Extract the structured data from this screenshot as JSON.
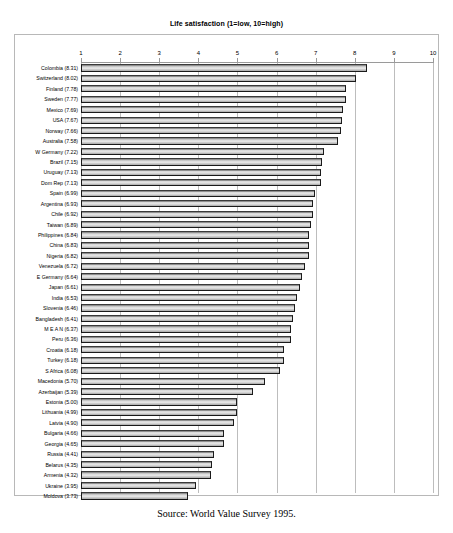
{
  "chart_data": {
    "type": "bar",
    "orientation": "horizontal",
    "title": "Life satisfaction (1=low, 10=high)",
    "xlabel": "",
    "ylabel": "",
    "xlim": [
      1,
      10
    ],
    "grid": true,
    "legend": null,
    "tick_labels": [
      "1",
      "2",
      "3",
      "4",
      "5",
      "6",
      "7",
      "8",
      "9",
      "10"
    ],
    "categories": [
      "Colombia",
      "Switzerland",
      "Finland",
      "Sweden",
      "Mexico",
      "USA",
      "Norway",
      "Australia",
      "W Germany",
      "Brazil",
      "Uruguay",
      "Dom Rep",
      "Spain",
      "Argentina",
      "Chile",
      "Taiwan",
      "Philippines",
      "China",
      "Nigeria",
      "Venezuela",
      "E Germany",
      "Japan",
      "India",
      "Slovenia",
      "Bangladesh",
      "M E A N",
      "Peru",
      "Croatia",
      "Turkey",
      "S Africa",
      "Macedonia",
      "Azerbaijan",
      "Estonia",
      "Lithuania",
      "Latvia",
      "Bulgaria",
      "Georgia",
      "Russia",
      "Belarus",
      "Armenia",
      "Ukraine",
      "Moldova"
    ],
    "values": [
      8.31,
      8.02,
      7.78,
      7.77,
      7.69,
      7.67,
      7.66,
      7.58,
      7.22,
      7.15,
      7.13,
      7.13,
      6.99,
      6.93,
      6.92,
      6.89,
      6.84,
      6.83,
      6.82,
      6.72,
      6.64,
      6.61,
      6.53,
      6.46,
      6.41,
      6.37,
      6.36,
      6.18,
      6.18,
      6.08,
      5.7,
      5.39,
      5.0,
      4.99,
      4.9,
      4.66,
      4.65,
      4.41,
      4.35,
      4.32,
      3.95,
      3.73
    ],
    "row_labels": [
      "Colombia (8.31)",
      "Switzerland (8.02)",
      "Finland (7.78)",
      "Sweden (7.77)",
      "Mexico (7.69)",
      "USA (7.67)",
      "Norway (7.66)",
      "Australia (7.58)",
      "W Germany (7.22)",
      "Brazil (7.15)",
      "Uruguay (7.13)",
      "Dom Rep (7.13)",
      "Spain (6.99)",
      "Argentina (6.93)",
      "Chile (6.92)",
      "Taiwan (6.89)",
      "Philippines (6.84)",
      "China (6.83)",
      "Nigeria (6.82)",
      "Venezuela (6.72)",
      "E Germany (6.64)",
      "Japan (6.61)",
      "India (6.53)",
      "Slovenia (6.46)",
      "Bangladesh (6.41)",
      "M E A N (6.37)",
      "Peru (6.36)",
      "Croatia (6.18)",
      "Turkey (6.18)",
      "S Africa (6.08)",
      "Macedonia (5.70)",
      "Azerbaijan (5.39)",
      "Estonia (5.00)",
      "Lithuania (4.99)",
      "Latvia (4.90)",
      "Bulgaria (4.66)",
      "Georgia (4.65)",
      "Russia (4.41)",
      "Belarus (4.35)",
      "Armenia (4.32)",
      "Ukraine (3.95)",
      "Moldova (3.73)"
    ],
    "bar_fill_color": "#d0d0d0",
    "bar_border_color": "#1a1a1a",
    "gridline_color": "#bdbdbd"
  },
  "source": {
    "caption": "Source: World Value Survey 1995."
  }
}
